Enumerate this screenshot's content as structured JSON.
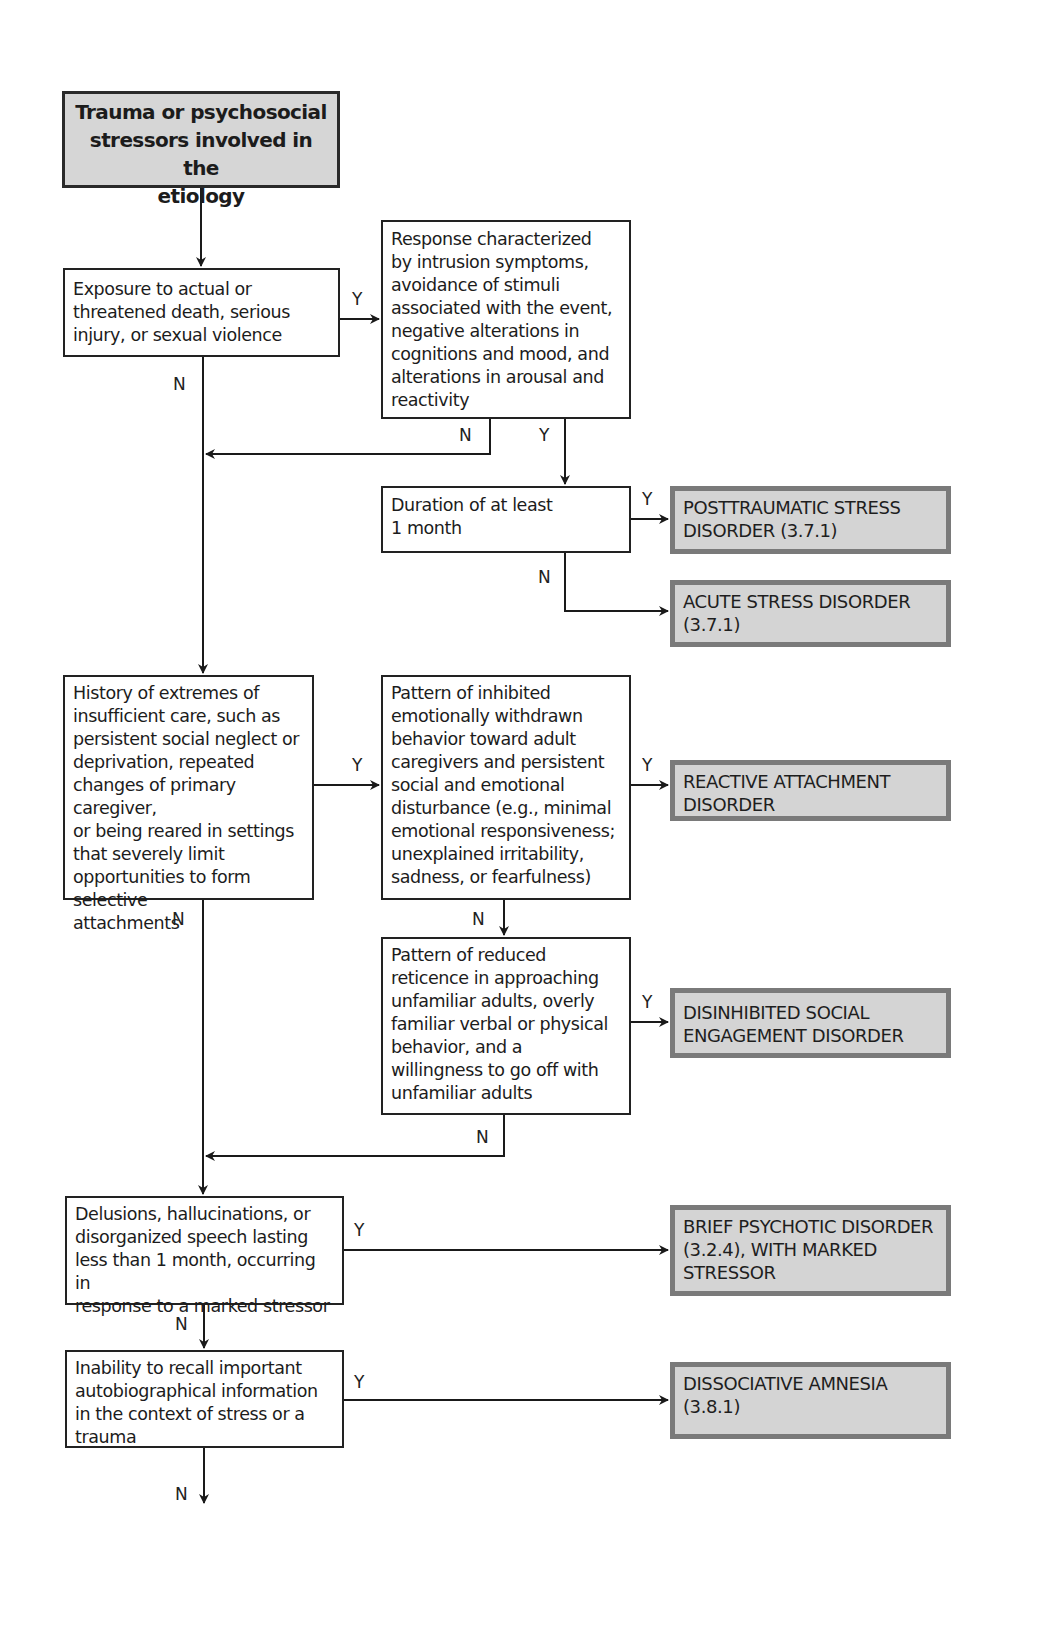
{
  "diagram": {
    "start": {
      "text": "Trauma or psychosocial stressors involved in the etiology",
      "lines": [
        "Trauma or psychosocial",
        "stressors involved in the",
        "etiology"
      ]
    },
    "decisions": [
      {
        "id": "exposure",
        "lines": [
          "Exposure to actual or",
          "threatened death, serious",
          "injury, or sexual violence"
        ]
      },
      {
        "id": "response",
        "lines": [
          "Response characterized",
          "by intrusion symptoms,",
          "avoidance of stimuli",
          "associated with the event,",
          "negative alterations in",
          "cognitions and mood, and",
          "alterations in arousal and",
          "reactivity"
        ]
      },
      {
        "id": "duration",
        "lines": [
          "Duration of at least",
          "1 month"
        ]
      },
      {
        "id": "history",
        "lines": [
          "History of extremes of",
          "insufficient care, such as",
          "persistent social neglect or",
          "deprivation, repeated",
          "changes of primary caregiver,",
          "or being reared in settings",
          "that severely limit",
          "opportunities to form selective",
          "attachments"
        ]
      },
      {
        "id": "inhibited",
        "lines": [
          "Pattern of inhibited",
          "emotionally withdrawn",
          "behavior toward adult",
          "caregivers and persistent",
          "social and emotional",
          "disturbance (e.g., minimal",
          "emotional responsiveness;",
          "unexplained irritability,",
          "sadness, or fearfulness)"
        ]
      },
      {
        "id": "reduced",
        "lines": [
          "Pattern of reduced",
          "reticence in approaching",
          "unfamiliar adults, overly",
          "familiar verbal or physical",
          "behavior, and a",
          "willingness to go off with",
          "unfamiliar adults"
        ]
      },
      {
        "id": "delusions",
        "lines": [
          "Delusions, hallucinations, or",
          "disorganized speech lasting",
          "less than 1 month, occurring in",
          "response to a marked stressor"
        ]
      },
      {
        "id": "inability",
        "lines": [
          "Inability to recall important",
          "autobiographical information",
          "in the context of stress or a",
          "trauma"
        ]
      }
    ],
    "outcomes": [
      {
        "id": "ptsd",
        "lines": [
          "POSTTRAUMATIC STRESS",
          "DISORDER (3.7.1)"
        ]
      },
      {
        "id": "asd",
        "lines": [
          "ACUTE STRESS DISORDER",
          "(3.7.1)"
        ]
      },
      {
        "id": "rad",
        "lines": [
          "REACTIVE ATTACHMENT",
          "DISORDER"
        ]
      },
      {
        "id": "dsed",
        "lines": [
          "DISINHIBITED SOCIAL",
          "ENGAGEMENT DISORDER"
        ]
      },
      {
        "id": "bpd",
        "lines": [
          "BRIEF PSYCHOTIC DISORDER",
          "(3.2.4), WITH MARKED",
          "STRESSOR"
        ]
      },
      {
        "id": "da",
        "lines": [
          "DISSOCIATIVE AMNESIA",
          "(3.8.1)"
        ]
      }
    ],
    "edge_labels": {
      "yes": "Y",
      "no": "N"
    }
  }
}
